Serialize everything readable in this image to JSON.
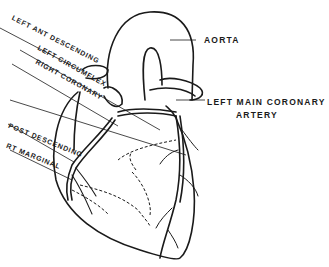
{
  "diagram": {
    "labels": {
      "aorta": "AORTA",
      "left_main_line1": "LEFT MAIN CORONARY",
      "left_main_line2": "ARTERY",
      "left_ant_descending": "LEFT ANT DESCENDING",
      "left_circumflex": "LEFT CIRCUMFLEX",
      "right_coronary": "RIGHT CORONARY",
      "post_descending": "POST DESCENDING",
      "rt_marginal": "RT MARGINAL"
    },
    "colors": {
      "ink": "#1a1a1a",
      "background": "#ffffff"
    }
  }
}
